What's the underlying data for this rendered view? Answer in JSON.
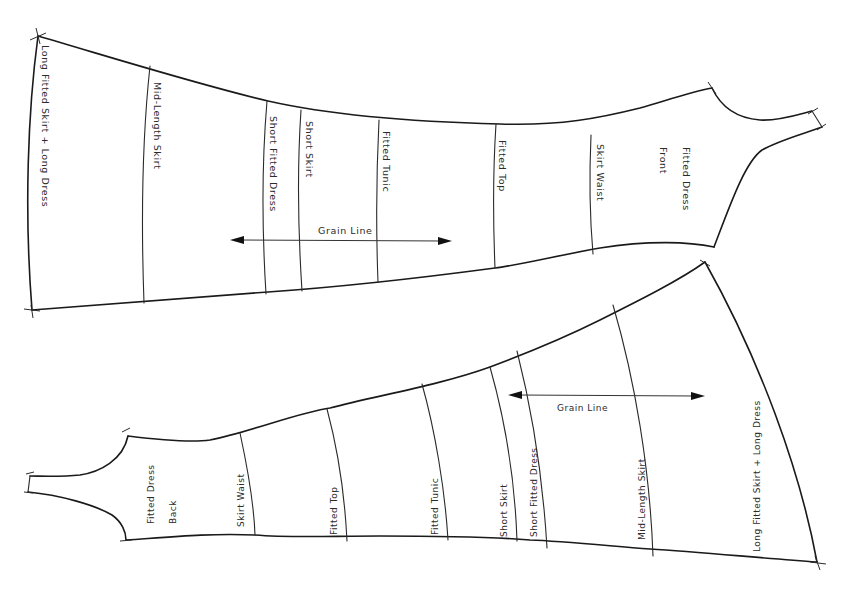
{
  "diagram": {
    "type": "sewing-pattern",
    "pieces": [
      {
        "id": "front",
        "title": "Fitted Dress",
        "subtitle": "Front",
        "length_lines": [
          {
            "label": "Long Fitted Skirt + Long Dress"
          },
          {
            "label": "Mid-Length Skirt"
          },
          {
            "label": "Short Fitted Dress"
          },
          {
            "label": "Short Skirt"
          },
          {
            "label": "Fitted Tunic"
          },
          {
            "label": "Fitted Top"
          },
          {
            "label": "Skirt Waist"
          }
        ],
        "grain_line": {
          "label": "Grain Line"
        }
      },
      {
        "id": "back",
        "title": "Fitted Dress",
        "subtitle": "Back",
        "length_lines": [
          {
            "label": "Skirt Waist"
          },
          {
            "label": "Fitted Top"
          },
          {
            "label": "Fitted Tunic"
          },
          {
            "label": "Short Skirt"
          },
          {
            "label": "Short Fitted Dress"
          },
          {
            "label": "Mid-Length Skirt"
          },
          {
            "label": "Long Fitted Skirt + Long Dress"
          }
        ],
        "grain_line": {
          "label": "Grain Line"
        }
      }
    ],
    "colors": {
      "background": "#ffffff",
      "ink": "#1a1a1a"
    }
  }
}
